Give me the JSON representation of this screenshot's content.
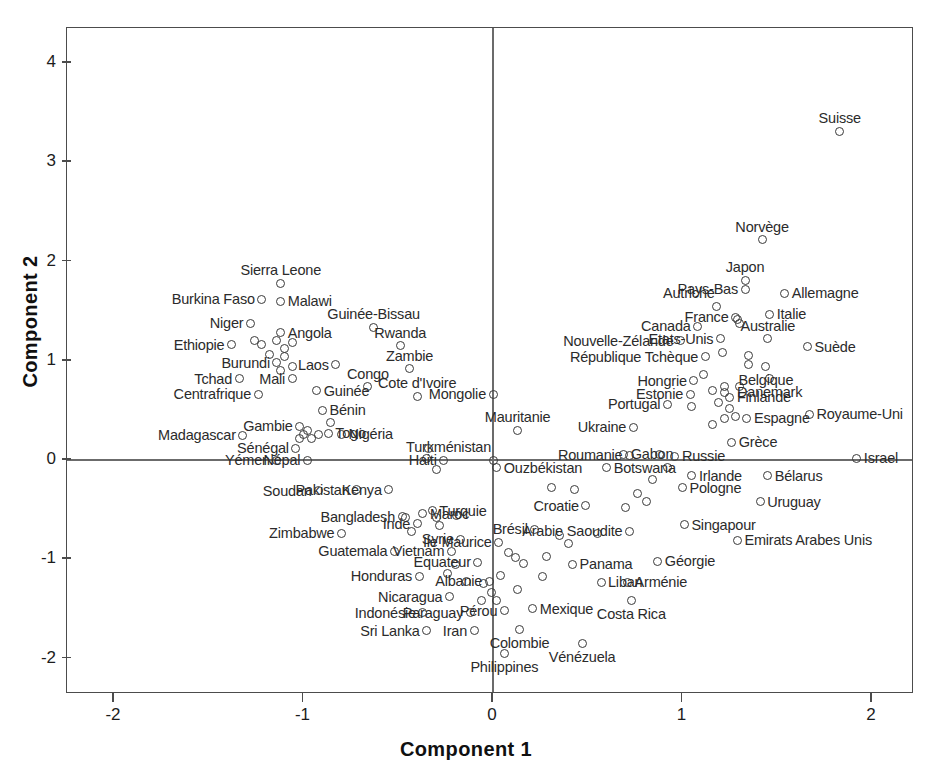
{
  "chart_data": {
    "type": "scatter",
    "title": "",
    "subtitle": "",
    "xlabel": "Component 1",
    "ylabel": "Component 2",
    "xlim": [
      -2.24,
      2.24
    ],
    "ylim": [
      -2.36,
      4.35
    ],
    "xticks": [
      -2,
      -1,
      0,
      1,
      2
    ],
    "yticks": [
      -2,
      -1,
      0,
      1,
      2,
      3,
      4
    ],
    "xtick_labels": [
      "-2",
      "-1",
      "0",
      "1",
      "2"
    ],
    "ytick_labels": [
      "-2",
      "-1",
      "0",
      "1",
      "2",
      "3",
      "4"
    ],
    "grid": false,
    "legend": null,
    "reference_lines": [
      {
        "axis": "y",
        "value": 0
      },
      {
        "axis": "x",
        "value": 0
      }
    ],
    "marker_style": "open-circle",
    "marker_color": "#3a3a3a",
    "axis_color": "#4c4c4c",
    "point_count": 129,
    "points": [
      {
        "label": "Suisse",
        "x": 1.83,
        "y": 3.31,
        "lpos": "above"
      },
      {
        "label": "Norvège",
        "x": 1.42,
        "y": 2.22,
        "lpos": "above"
      },
      {
        "label": "Japon",
        "x": 1.33,
        "y": 1.81,
        "lpos": "above"
      },
      {
        "label": "Pays-Bas",
        "x": 1.33,
        "y": 1.72,
        "lpos": "left"
      },
      {
        "label": "Allemagne",
        "x": 1.54,
        "y": 1.68,
        "lpos": "right"
      },
      {
        "label": "Autriche",
        "x": 1.18,
        "y": 1.55,
        "lpos": "above-left"
      },
      {
        "label": "Italie",
        "x": 1.46,
        "y": 1.47,
        "lpos": "right"
      },
      {
        "label": "France",
        "x": 1.28,
        "y": 1.44,
        "lpos": "left"
      },
      {
        "label": "Canada",
        "x": 1.08,
        "y": 1.35,
        "lpos": "left"
      },
      {
        "label": "Australie",
        "x": 1.45,
        "y": 1.22,
        "lpos": "above"
      },
      {
        "label": "Suède",
        "x": 1.66,
        "y": 1.14,
        "lpos": "right"
      },
      {
        "label": "Etats-Unis",
        "x": 1.2,
        "y": 1.22,
        "lpos": "left"
      },
      {
        "label": "Nouvelle-Zélande",
        "x": 0.99,
        "y": 1.2,
        "lpos": "left"
      },
      {
        "label": "République Tchèque",
        "x": 1.12,
        "y": 1.04,
        "lpos": "left"
      },
      {
        "label": "Belgique",
        "x": 1.44,
        "y": 0.94,
        "lpos": "below"
      },
      {
        "label": "Danemark",
        "x": 1.46,
        "y": 0.82,
        "lpos": "below"
      },
      {
        "label": "Hongrie",
        "x": 1.06,
        "y": 0.8,
        "lpos": "left"
      },
      {
        "label": "Finlande",
        "x": 1.25,
        "y": 0.63,
        "lpos": "right"
      },
      {
        "label": "Estonie",
        "x": 1.04,
        "y": 0.66,
        "lpos": "left"
      },
      {
        "label": "Portugal",
        "x": 0.92,
        "y": 0.56,
        "lpos": "left"
      },
      {
        "label": "Royaume-Uni",
        "x": 1.67,
        "y": 0.46,
        "lpos": "right"
      },
      {
        "label": "Espagne",
        "x": 1.34,
        "y": 0.42,
        "lpos": "right"
      },
      {
        "label": "Ukraine",
        "x": 0.74,
        "y": 0.33,
        "lpos": "left"
      },
      {
        "label": "Grèce",
        "x": 1.26,
        "y": 0.18,
        "lpos": "right"
      },
      {
        "label": "Israel",
        "x": 1.92,
        "y": 0.02,
        "lpos": "right"
      },
      {
        "label": "Roumanie",
        "x": 0.72,
        "y": 0.05,
        "lpos": "left"
      },
      {
        "label": "Russie",
        "x": 0.96,
        "y": 0.04,
        "lpos": "right"
      },
      {
        "label": "Irlande",
        "x": 1.05,
        "y": -0.16,
        "lpos": "right"
      },
      {
        "label": "Bélarus",
        "x": 1.45,
        "y": -0.16,
        "lpos": "right"
      },
      {
        "label": "Pologne",
        "x": 1.0,
        "y": -0.28,
        "lpos": "right"
      },
      {
        "label": "Uruguay",
        "x": 1.41,
        "y": -0.42,
        "lpos": "right"
      },
      {
        "label": "Croatie",
        "x": 0.49,
        "y": -0.46,
        "lpos": "left"
      },
      {
        "label": "Singapour",
        "x": 1.01,
        "y": -0.65,
        "lpos": "right"
      },
      {
        "label": "Arabie Saoudite",
        "x": 0.72,
        "y": -0.72,
        "lpos": "left"
      },
      {
        "label": "Emirats Arabes Unis",
        "x": 1.29,
        "y": -0.81,
        "lpos": "right"
      },
      {
        "label": "Géorgie",
        "x": 0.87,
        "y": -1.02,
        "lpos": "right"
      },
      {
        "label": "Arménie",
        "x": 0.71,
        "y": -1.23,
        "lpos": "right"
      },
      {
        "label": "Liban",
        "x": 0.57,
        "y": -1.23,
        "lpos": "right"
      },
      {
        "label": "Costa Rica",
        "x": 0.73,
        "y": -1.42,
        "lpos": "below"
      },
      {
        "label": "Panama",
        "x": 0.42,
        "y": -1.05,
        "lpos": "right"
      },
      {
        "label": "Vénézuela",
        "x": 0.47,
        "y": -1.85,
        "lpos": "below"
      },
      {
        "label": "Mexique",
        "x": 0.21,
        "y": -1.5,
        "lpos": "right"
      },
      {
        "label": "Pérou",
        "x": 0.06,
        "y": -1.52,
        "lpos": "left"
      },
      {
        "label": "Colombie",
        "x": 0.14,
        "y": -1.71,
        "lpos": "below"
      },
      {
        "label": "Philippines",
        "x": 0.06,
        "y": -1.95,
        "lpos": "below"
      },
      {
        "label": "Iran",
        "x": -0.1,
        "y": -1.72,
        "lpos": "left"
      },
      {
        "label": "Sri Lanka",
        "x": -0.35,
        "y": -1.72,
        "lpos": "left"
      },
      {
        "label": "Paraguay",
        "x": -0.12,
        "y": -1.54,
        "lpos": "left"
      },
      {
        "label": "Indonésie",
        "x": -0.37,
        "y": -1.54,
        "lpos": "left"
      },
      {
        "label": "Nicaragua",
        "x": -0.23,
        "y": -1.38,
        "lpos": "left"
      },
      {
        "label": "Albanie",
        "x": -0.02,
        "y": -1.22,
        "lpos": "left"
      },
      {
        "label": "Equateur",
        "x": -0.08,
        "y": -1.03,
        "lpos": "left"
      },
      {
        "label": "Honduras",
        "x": -0.39,
        "y": -1.17,
        "lpos": "left"
      },
      {
        "label": "Vietnam",
        "x": -0.22,
        "y": -0.92,
        "lpos": "left"
      },
      {
        "label": "Ile Maurice",
        "x": 0.03,
        "y": -0.83,
        "lpos": "left"
      },
      {
        "label": "Syrie",
        "x": -0.17,
        "y": -0.8,
        "lpos": "left"
      },
      {
        "label": "Brésil",
        "x": 0.22,
        "y": -0.7,
        "lpos": "left"
      },
      {
        "label": "Guatemala",
        "x": -0.52,
        "y": -0.92,
        "lpos": "left"
      },
      {
        "label": "Zimbabwe",
        "x": -0.8,
        "y": -0.74,
        "lpos": "left"
      },
      {
        "label": "Inde",
        "x": -0.4,
        "y": -0.64,
        "lpos": "left"
      },
      {
        "label": "Maroc",
        "x": -0.37,
        "y": -0.54,
        "lpos": "right"
      },
      {
        "label": "Turquie",
        "x": -0.32,
        "y": -0.51,
        "lpos": "right"
      },
      {
        "label": "Bangladesh",
        "x": -0.48,
        "y": -0.57,
        "lpos": "left"
      },
      {
        "label": "Kenya",
        "x": -0.55,
        "y": -0.3,
        "lpos": "left"
      },
      {
        "label": "Pakistan",
        "x": -0.72,
        "y": -0.3,
        "lpos": "left"
      },
      {
        "label": "Soudan",
        "x": -0.92,
        "y": -0.31,
        "lpos": "left"
      },
      {
        "label": "Ouzbékistan",
        "x": 0.02,
        "y": -0.08,
        "lpos": "right"
      },
      {
        "label": "Botswana",
        "x": 0.6,
        "y": -0.08,
        "lpos": "right"
      },
      {
        "label": "Turkménistan",
        "x": 0.0,
        "y": 0.0,
        "lpos": "above-left"
      },
      {
        "label": "Gabon",
        "x": 0.69,
        "y": 0.06,
        "lpos": "right"
      },
      {
        "label": "Haiti",
        "x": -0.26,
        "y": 0.0,
        "lpos": "left"
      },
      {
        "label": "Népal",
        "x": -0.98,
        "y": 0.0,
        "lpos": "left"
      },
      {
        "label": "Yémen",
        "x": -1.14,
        "y": 0.0,
        "lpos": "left"
      },
      {
        "label": "Sénégal",
        "x": -1.04,
        "y": 0.12,
        "lpos": "left"
      },
      {
        "label": "Nigéria",
        "x": -0.8,
        "y": 0.26,
        "lpos": "right"
      },
      {
        "label": "Togo",
        "x": -0.87,
        "y": 0.27,
        "lpos": "right"
      },
      {
        "label": "Mauritanie",
        "x": 0.13,
        "y": 0.3,
        "lpos": "above"
      },
      {
        "label": "Madagascar",
        "x": -1.32,
        "y": 0.25,
        "lpos": "left"
      },
      {
        "label": "Gambie",
        "x": -1.02,
        "y": 0.34,
        "lpos": "left"
      },
      {
        "label": "Bénin",
        "x": -0.9,
        "y": 0.5,
        "lpos": "right"
      },
      {
        "label": "Cote d'Ivoire",
        "x": -0.4,
        "y": 0.64,
        "lpos": "above"
      },
      {
        "label": "Guinée",
        "x": -0.93,
        "y": 0.7,
        "lpos": "right"
      },
      {
        "label": "Centrafrique",
        "x": -1.24,
        "y": 0.66,
        "lpos": "left"
      },
      {
        "label": "Congo",
        "x": -0.66,
        "y": 0.74,
        "lpos": "above"
      },
      {
        "label": "Mali",
        "x": -1.06,
        "y": 0.82,
        "lpos": "left"
      },
      {
        "label": "Tchad",
        "x": -1.34,
        "y": 0.82,
        "lpos": "left"
      },
      {
        "label": "Zambie",
        "x": -0.44,
        "y": 0.92,
        "lpos": "above"
      },
      {
        "label": "Laos",
        "x": -0.83,
        "y": 0.96,
        "lpos": "left"
      },
      {
        "label": "Burundi",
        "x": -1.14,
        "y": 0.98,
        "lpos": "left"
      },
      {
        "label": "Rwanda",
        "x": -0.49,
        "y": 1.15,
        "lpos": "above"
      },
      {
        "label": "Ethiopie",
        "x": -1.38,
        "y": 1.16,
        "lpos": "left"
      },
      {
        "label": "Angola",
        "x": -1.12,
        "y": 1.28,
        "lpos": "right"
      },
      {
        "label": "Guinée-Bissau",
        "x": -0.63,
        "y": 1.34,
        "lpos": "above"
      },
      {
        "label": "Niger",
        "x": -1.28,
        "y": 1.38,
        "lpos": "left"
      },
      {
        "label": "Malawi",
        "x": -1.12,
        "y": 1.6,
        "lpos": "right"
      },
      {
        "label": "Burkina Faso",
        "x": -1.22,
        "y": 1.62,
        "lpos": "left"
      },
      {
        "label": "Sierra Leone",
        "x": -1.12,
        "y": 1.78,
        "lpos": "above"
      },
      {
        "label": "Mongolie",
        "x": 0.0,
        "y": 0.66,
        "lpos": "left"
      },
      {
        "label": "",
        "x": 1.29,
        "y": 1.42,
        "lpos": "none"
      },
      {
        "label": "",
        "x": 1.3,
        "y": 1.38,
        "lpos": "none"
      },
      {
        "label": "",
        "x": 1.21,
        "y": 1.08,
        "lpos": "none"
      },
      {
        "label": "",
        "x": 1.35,
        "y": 1.05,
        "lpos": "none"
      },
      {
        "label": "",
        "x": 1.35,
        "y": 0.96,
        "lpos": "none"
      },
      {
        "label": "",
        "x": 1.11,
        "y": 0.86,
        "lpos": "none"
      },
      {
        "label": "",
        "x": 1.22,
        "y": 0.74,
        "lpos": "none"
      },
      {
        "label": "",
        "x": 1.3,
        "y": 0.74,
        "lpos": "none"
      },
      {
        "label": "",
        "x": 1.16,
        "y": 0.7,
        "lpos": "none"
      },
      {
        "label": "",
        "x": 1.22,
        "y": 0.68,
        "lpos": "none"
      },
      {
        "label": "",
        "x": 1.19,
        "y": 0.58,
        "lpos": "none"
      },
      {
        "label": "",
        "x": 1.25,
        "y": 0.52,
        "lpos": "none"
      },
      {
        "label": "",
        "x": 1.05,
        "y": 0.54,
        "lpos": "none"
      },
      {
        "label": "",
        "x": 1.22,
        "y": 0.42,
        "lpos": "none"
      },
      {
        "label": "",
        "x": 1.28,
        "y": 0.44,
        "lpos": "none"
      },
      {
        "label": "",
        "x": 1.16,
        "y": 0.36,
        "lpos": "none"
      },
      {
        "label": "",
        "x": 0.88,
        "y": 0.06,
        "lpos": "none"
      },
      {
        "label": "",
        "x": 0.92,
        "y": -0.08,
        "lpos": "none"
      },
      {
        "label": "",
        "x": 0.84,
        "y": -0.2,
        "lpos": "none"
      },
      {
        "label": "",
        "x": 0.76,
        "y": -0.34,
        "lpos": "none"
      },
      {
        "label": "",
        "x": 0.81,
        "y": -0.42,
        "lpos": "none"
      },
      {
        "label": "",
        "x": 0.7,
        "y": -0.48,
        "lpos": "none"
      },
      {
        "label": "",
        "x": 0.31,
        "y": -0.28,
        "lpos": "none"
      },
      {
        "label": "",
        "x": 0.43,
        "y": -0.3,
        "lpos": "none"
      },
      {
        "label": "",
        "x": 0.55,
        "y": -0.74,
        "lpos": "none"
      },
      {
        "label": "",
        "x": 0.4,
        "y": -0.84,
        "lpos": "none"
      },
      {
        "label": "",
        "x": 0.35,
        "y": -0.76,
        "lpos": "none"
      },
      {
        "label": "",
        "x": 0.28,
        "y": -0.97,
        "lpos": "none"
      },
      {
        "label": "",
        "x": 0.26,
        "y": -1.17,
        "lpos": "none"
      },
      {
        "label": "",
        "x": 0.13,
        "y": -1.3,
        "lpos": "none"
      },
      {
        "label": "",
        "x": 0.16,
        "y": -1.04,
        "lpos": "none"
      },
      {
        "label": "",
        "x": 0.08,
        "y": -0.93,
        "lpos": "none"
      },
      {
        "label": "",
        "x": 0.12,
        "y": -0.98,
        "lpos": "none"
      },
      {
        "label": "",
        "x": 0.04,
        "y": -1.16,
        "lpos": "none"
      },
      {
        "label": "",
        "x": -0.01,
        "y": -1.34,
        "lpos": "none"
      },
      {
        "label": "",
        "x": 0.02,
        "y": -1.42,
        "lpos": "none"
      },
      {
        "label": "",
        "x": -0.06,
        "y": -1.42,
        "lpos": "none"
      },
      {
        "label": "",
        "x": -0.05,
        "y": -1.24,
        "lpos": "none"
      },
      {
        "label": "",
        "x": -0.14,
        "y": -1.22,
        "lpos": "none"
      },
      {
        "label": "",
        "x": -0.2,
        "y": -1.05,
        "lpos": "none"
      },
      {
        "label": "",
        "x": -0.24,
        "y": -1.14,
        "lpos": "none"
      },
      {
        "label": "",
        "x": -0.28,
        "y": -0.66,
        "lpos": "none"
      },
      {
        "label": "",
        "x": -0.3,
        "y": -0.58,
        "lpos": "none"
      },
      {
        "label": "",
        "x": -0.43,
        "y": -0.72,
        "lpos": "none"
      },
      {
        "label": "",
        "x": -0.46,
        "y": -0.58,
        "lpos": "none"
      },
      {
        "label": "",
        "x": -0.19,
        "y": -0.56,
        "lpos": "none"
      },
      {
        "label": "",
        "x": -0.35,
        "y": 0.02,
        "lpos": "none"
      },
      {
        "label": "",
        "x": -0.3,
        "y": -0.1,
        "lpos": "none"
      },
      {
        "label": "",
        "x": -0.34,
        "y": 0.12,
        "lpos": "none"
      },
      {
        "label": "",
        "x": -0.86,
        "y": 0.38,
        "lpos": "none"
      },
      {
        "label": "",
        "x": -0.92,
        "y": 0.26,
        "lpos": "none"
      },
      {
        "label": "",
        "x": -0.96,
        "y": 0.22,
        "lpos": "none"
      },
      {
        "label": "",
        "x": -1.0,
        "y": 0.26,
        "lpos": "none"
      },
      {
        "label": "",
        "x": -1.02,
        "y": 0.22,
        "lpos": "none"
      },
      {
        "label": "",
        "x": -0.98,
        "y": 0.3,
        "lpos": "none"
      },
      {
        "label": "",
        "x": -1.06,
        "y": 1.18,
        "lpos": "none"
      },
      {
        "label": "",
        "x": -1.1,
        "y": 1.12,
        "lpos": "none"
      },
      {
        "label": "",
        "x": -1.18,
        "y": 1.06,
        "lpos": "none"
      },
      {
        "label": "",
        "x": -1.14,
        "y": 1.2,
        "lpos": "none"
      },
      {
        "label": "",
        "x": -1.1,
        "y": 1.04,
        "lpos": "none"
      },
      {
        "label": "",
        "x": -1.06,
        "y": 0.94,
        "lpos": "none"
      },
      {
        "label": "",
        "x": -1.12,
        "y": 0.9,
        "lpos": "none"
      },
      {
        "label": "",
        "x": -1.22,
        "y": 1.16,
        "lpos": "none"
      },
      {
        "label": "",
        "x": -1.26,
        "y": 1.2,
        "lpos": "none"
      }
    ]
  },
  "axes": {
    "xlabel": "Component 1",
    "ylabel": "Component 2"
  }
}
